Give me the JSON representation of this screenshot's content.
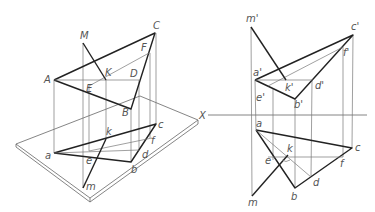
{
  "figure": {
    "left_view": {
      "type": "pictorial",
      "space_points": {
        "M": {
          "label": "M",
          "x": 83,
          "y": 43
        },
        "A": {
          "label": "A",
          "x": 54,
          "y": 80
        },
        "C": {
          "label": "C",
          "x": 155,
          "y": 33
        },
        "B": {
          "label": "B",
          "x": 131,
          "y": 109
        },
        "K": {
          "label": "K",
          "x": 106,
          "y": 80
        },
        "D": {
          "label": "D",
          "x": 140,
          "y": 80
        },
        "E": {
          "label": "E",
          "x": 89,
          "y": 86
        },
        "F": {
          "label": "F",
          "x": 149,
          "y": 53
        }
      },
      "plane_points": {
        "a": {
          "label": "a",
          "x": 54,
          "y": 153
        },
        "c": {
          "label": "c",
          "x": 156,
          "y": 124
        },
        "b": {
          "label": "b",
          "x": 131,
          "y": 162
        },
        "k": {
          "label": "k",
          "x": 106,
          "y": 139
        },
        "d": {
          "label": "d",
          "x": 139,
          "y": 150
        },
        "e": {
          "label": "e",
          "x": 89,
          "y": 151
        },
        "f": {
          "label": "f",
          "x": 152,
          "y": 138
        },
        "m": {
          "label": "m",
          "x": 83,
          "y": 188
        }
      }
    },
    "right_view": {
      "type": "orthographic",
      "axis_label": "X",
      "front_points": {
        "m1": {
          "label": "m'",
          "x": 251,
          "y": 27
        },
        "c1": {
          "label": "c'",
          "x": 353,
          "y": 35
        },
        "a1": {
          "label": "a'",
          "x": 255,
          "y": 80
        },
        "k1": {
          "label": "k'",
          "x": 286,
          "y": 80
        },
        "d1": {
          "label": "d'",
          "x": 313,
          "y": 80
        },
        "b1": {
          "label": "b'",
          "x": 295,
          "y": 99
        },
        "e1": {
          "label": "e'",
          "x": 273,
          "y": 88
        },
        "f1": {
          "label": "f'",
          "x": 343,
          "y": 47
        }
      },
      "top_points": {
        "a": {
          "label": "a",
          "x": 256,
          "y": 130
        },
        "c": {
          "label": "c",
          "x": 352,
          "y": 148
        },
        "b": {
          "label": "b",
          "x": 295,
          "y": 188
        },
        "k": {
          "label": "k",
          "x": 288,
          "y": 155
        },
        "e": {
          "label": "e",
          "x": 273,
          "y": 160
        },
        "d": {
          "label": "d",
          "x": 311,
          "y": 177
        },
        "f": {
          "label": "f",
          "x": 343,
          "y": 157
        },
        "m": {
          "label": "m",
          "x": 252,
          "y": 196
        }
      }
    }
  }
}
